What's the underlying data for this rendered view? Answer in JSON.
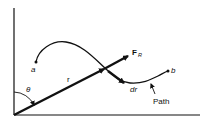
{
  "diagram": {
    "labels": {
      "start_point": "a",
      "end_point": "b",
      "position_vector": "r",
      "angle": "θ",
      "force_main": "F",
      "force_sub": "R",
      "displacement": "dr",
      "path": "Path"
    },
    "colors": {
      "stroke": "#111111",
      "background": "#ffffff"
    }
  }
}
